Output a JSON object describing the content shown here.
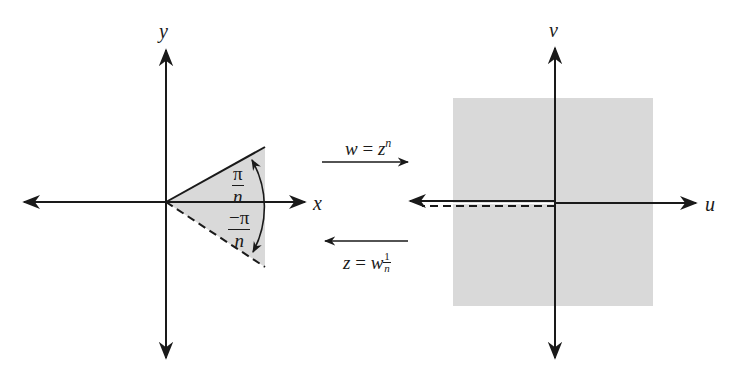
{
  "left_plane": {
    "x_axis_label": "x",
    "y_axis_label": "y",
    "upper_angle": {
      "numerator": "π",
      "denominator": "n"
    },
    "lower_angle": {
      "numerator": "−π",
      "denominator": "n"
    }
  },
  "mapping": {
    "forward": {
      "lhs": "w",
      "eq": " = ",
      "base": "z",
      "exponent": "n"
    },
    "inverse": {
      "lhs": "z",
      "eq": " = ",
      "base": "w",
      "exp_num": "1",
      "exp_den": "n"
    }
  },
  "right_plane": {
    "u_axis_label": "u",
    "v_axis_label": "v"
  },
  "colors": {
    "shade": "#d9d9d9",
    "ink": "#1a1a1a"
  }
}
